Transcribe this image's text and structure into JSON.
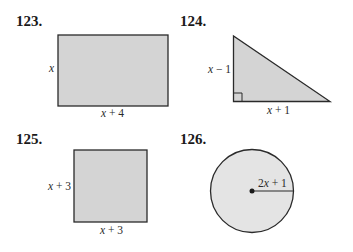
{
  "problems": [
    {
      "number": "123.",
      "shape": "rectangle",
      "side_label": "x",
      "bottom_label": "x + 4"
    },
    {
      "number": "124.",
      "shape": "right-triangle",
      "side_label": "x − 1",
      "bottom_label": "x + 1"
    },
    {
      "number": "125.",
      "shape": "square",
      "side_label": "x + 3",
      "bottom_label": "x + 3"
    },
    {
      "number": "126.",
      "shape": "circle",
      "radius_label": "2x + 1"
    }
  ],
  "colors": {
    "fill": "#d4d4d4",
    "circle_fill": "#e4e4e4",
    "stroke": "#2a2a2a"
  }
}
